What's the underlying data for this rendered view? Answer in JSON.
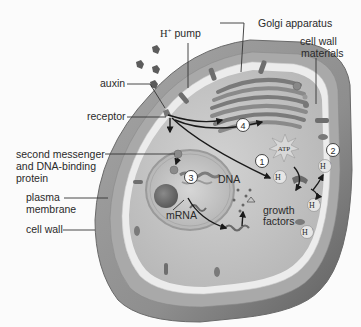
{
  "diagram": {
    "labels": {
      "h_pump": "H",
      "h_pump_sup": "+",
      "h_pump_suffix": " pump",
      "golgi": "Golgi apparatus",
      "cell_wall_materials_1": "cell wall",
      "cell_wall_materials_2": "materials",
      "auxin": "auxin",
      "receptor": "receptor",
      "second_messenger_1": "second messenger",
      "second_messenger_2": "and DNA-binding",
      "second_messenger_3": "protein",
      "plasma_membrane_1": "plasma",
      "plasma_membrane_2": "membrane",
      "cell_wall": "cell wall",
      "dna": "DNA",
      "mrna": "mRNA",
      "growth_factors_1": "growth",
      "growth_factors_2": "factors",
      "atp": "ATP"
    },
    "steps": [
      "1",
      "2",
      "3",
      "4"
    ],
    "ions": {
      "h_ion": "H",
      "h_ion_sup": "+"
    },
    "colors": {
      "background": "#fbfbfb",
      "cell_wall_outer": "#8c8c8c",
      "cell_wall_inner": "#a8a8a8",
      "plasma_membrane": "#e6e6e6",
      "cytoplasm": "#c4c4c4",
      "golgi": "#9a9a9a",
      "nucleus": "#bdbdbd",
      "text": "#2a2a2a"
    }
  }
}
